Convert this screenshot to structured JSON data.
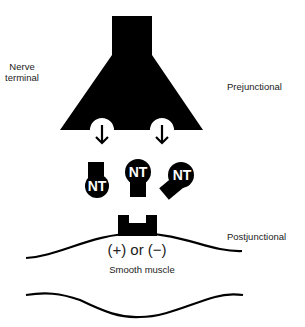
{
  "diagram": {
    "labels": {
      "nerve_terminal_line1": "Nerve",
      "nerve_terminal_line2": "terminal",
      "prejunctional": "Prejunctional",
      "postjunctional": "Postjunctional",
      "effect": "(+) or (−)",
      "smooth_muscle": "Smooth muscle"
    },
    "neurotransmitters": [
      {
        "label": "NT"
      },
      {
        "label": "NT"
      },
      {
        "label": "NT"
      }
    ],
    "colors": {
      "ink": "#000000",
      "text": "#222222",
      "background": "#ffffff"
    }
  }
}
